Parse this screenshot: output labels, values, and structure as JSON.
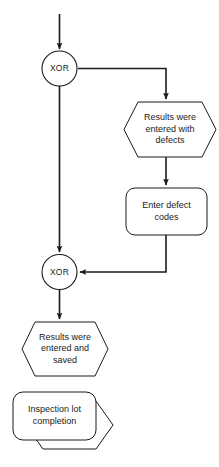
{
  "diagram": {
    "type": "flowchart",
    "notation": "EPC (event-driven process chain)",
    "background_color": "#ffffff",
    "stroke_color": "#1a1a1a",
    "fill_color": "#ffffff",
    "text_color": "#1a1a1a",
    "nodes": [
      {
        "id": "xor-top",
        "kind": "gateway",
        "shape": "circle",
        "label": "XOR",
        "cx": 59.5,
        "cy": 68.5,
        "r": 17.5
      },
      {
        "id": "event-results-defects",
        "kind": "event",
        "shape": "hexagon",
        "label": "Results were\nentered with\ndefects",
        "x": 124,
        "y": 102,
        "w": 92,
        "h": 55
      },
      {
        "id": "function-enter-defect-codes",
        "kind": "function",
        "shape": "rounded-rect",
        "label": "Enter defect\ncodes",
        "x": 126,
        "y": 188,
        "w": 81,
        "h": 47
      },
      {
        "id": "xor-bottom",
        "kind": "gateway",
        "shape": "circle",
        "label": "XOR",
        "cx": 59.5,
        "cy": 272,
        "r": 17.5
      },
      {
        "id": "event-results-saved",
        "kind": "event",
        "shape": "hexagon",
        "label": "Results were\nentered and\nsaved",
        "x": 22,
        "y": 322,
        "w": 86,
        "h": 54
      },
      {
        "id": "process-inspection-lot-completion",
        "kind": "process-interface",
        "shape": "rounded-rect-over-hexagon",
        "label": "Inspection lot\ncompletion",
        "x": 13,
        "y": 392,
        "w": 83,
        "h": 48,
        "shadow_offset_x": 17,
        "shadow_offset_y": 9
      }
    ],
    "connectors": [
      {
        "id": "in-to-xor-top",
        "from": "start",
        "to": "xor-top",
        "arrow": true,
        "points": "59.5,14 59.5,50"
      },
      {
        "id": "xor-top-to-event-defects",
        "from": "xor-top",
        "to": "event-results-defects",
        "arrow": true,
        "points": "77,68.5 166,68.5 166,100"
      },
      {
        "id": "event-defects-to-enter-codes",
        "from": "event-results-defects",
        "to": "function-enter-defect-codes",
        "arrow": true,
        "points": "166,157 166,186"
      },
      {
        "id": "enter-codes-to-xor-bottom",
        "from": "function-enter-defect-codes",
        "to": "xor-bottom",
        "arrow": true,
        "points": "166,235 166,272 79,272"
      },
      {
        "id": "xor-top-to-xor-bottom",
        "from": "xor-top",
        "to": "xor-bottom",
        "arrow": true,
        "points": "59.5,86 59.5,253"
      },
      {
        "id": "xor-bottom-to-event-saved",
        "from": "xor-bottom",
        "to": "event-results-saved",
        "arrow": true,
        "points": "59.5,290 59.5,320"
      }
    ]
  }
}
